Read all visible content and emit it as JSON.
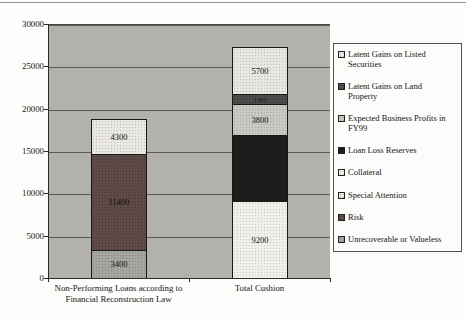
{
  "chart_data": {
    "type": "bar",
    "stacked": true,
    "title": "",
    "xlabel": "",
    "ylabel": "",
    "ylim": [
      0,
      30000
    ],
    "yticks": [
      0,
      5000,
      10000,
      15000,
      20000,
      25000,
      30000
    ],
    "grid": true,
    "legend_position": "right",
    "categories": [
      "Non-Performing Loans according to Financial Reconstruction Law",
      "Total Cushion"
    ],
    "category_lines": [
      [
        "Non-Performing Loans according to",
        "Financial Reconstruction Law"
      ],
      [
        "Total Cushion"
      ]
    ],
    "series": [
      {
        "name": "Unrecoverable or Valueless",
        "values": [
          3400,
          0
        ],
        "label": "3400"
      },
      {
        "name": "Risk",
        "values": [
          11400,
          0
        ],
        "label": "11400"
      },
      {
        "name": "Special Attention",
        "values": [
          4300,
          0
        ],
        "label": "4300"
      },
      {
        "name": "Collateral",
        "values": [
          0,
          9200
        ],
        "label": "9200"
      },
      {
        "name": "Loan Loss Reserves",
        "values": [
          0,
          7900
        ],
        "label": null
      },
      {
        "name": "Expected Business Profits in FY99",
        "values": [
          0,
          3800
        ],
        "label": "3800"
      },
      {
        "name": "Latent Gains on Land Property",
        "values": [
          0,
          1300
        ],
        "label": "1300"
      },
      {
        "name": "Latent Gains on Listed Securities",
        "values": [
          0,
          5700
        ],
        "label": "5700"
      }
    ]
  },
  "styles": {
    "Unrecoverable or Valueless": {
      "fill": "#a6a5a2",
      "dots": "#868583",
      "text": "#161616"
    },
    "Risk": {
      "fill": "#5e4a47",
      "dots": "#473734",
      "text": "#100c0b"
    },
    "Special Attention": {
      "fill": "#e9e8e3",
      "dots": "#c0bfba",
      "text": "#161616"
    },
    "Collateral": {
      "fill": "#f0efea",
      "dots": "#c8c7c2",
      "text": "#161616"
    },
    "Loan Loss Reserves": {
      "fill": "#1d1c1a",
      "dots": null,
      "text": "#1d1c1a"
    },
    "Expected Business Profits in FY99": {
      "fill": "#c9c8c3",
      "dots": "#a7a6a1",
      "text": "#161616"
    },
    "Latent Gains on Land Property": {
      "fill": "#4e4c4a",
      "dots": "#3b3937",
      "text": "#1b1b1b"
    },
    "Latent Gains on Listed Securities": {
      "fill": "#e7e6e1",
      "dots": "#bebdb8",
      "text": "#161616"
    }
  },
  "legend": {
    "position": "right",
    "items": [
      {
        "label": "Latent Gains on Listed Securities",
        "lines": [
          "Latent Gains on Listed",
          "Securities"
        ]
      },
      {
        "label": "Latent Gains on Land Property",
        "lines": [
          "Latent Gains on Land",
          "Property"
        ]
      },
      {
        "label": "Expected Business Profits in FY99",
        "lines": [
          "Expected Business Profits in",
          "FY99"
        ]
      },
      {
        "label": "Loan Loss Reserves",
        "lines": [
          "Loan Loss Reserves"
        ]
      },
      {
        "label": "Collateral",
        "lines": [
          "Collateral"
        ]
      },
      {
        "label": "Special Attention",
        "lines": [
          "Special Attention"
        ]
      },
      {
        "label": "Risk",
        "lines": [
          "Risk"
        ]
      },
      {
        "label": "Unrecoverable or Valueless",
        "lines": [
          "Unrecoverable or Valueless"
        ]
      }
    ]
  }
}
